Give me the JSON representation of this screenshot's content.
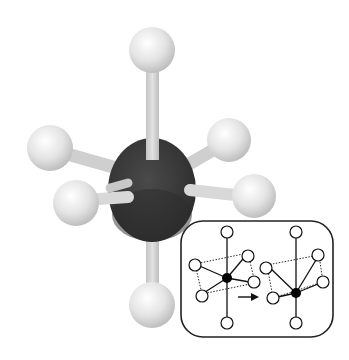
{
  "diagram": {
    "type": "molecular-geometry",
    "colors": {
      "background": "#ffffff",
      "central_atom": "#3a3a3a",
      "ligand_atom": "#e6e6e6",
      "bond": "#d4d4d4",
      "inset_border": "#222222",
      "inset_line": "#111111"
    },
    "central_atom": {
      "cx": 152,
      "cy": 190,
      "rx": 44,
      "ry": 52
    },
    "ligands": [
      {
        "id": "top",
        "cx": 152,
        "cy": 50,
        "r": 23
      },
      {
        "id": "upper-left",
        "cx": 50,
        "cy": 148,
        "r": 23
      },
      {
        "id": "upper-right",
        "cx": 229,
        "cy": 140,
        "r": 22
      },
      {
        "id": "lower-left",
        "cx": 76,
        "cy": 203,
        "r": 23
      },
      {
        "id": "lower-right",
        "cx": 254,
        "cy": 196,
        "r": 22
      },
      {
        "id": "bottom",
        "cx": 152,
        "cy": 305,
        "r": 23
      }
    ],
    "inset": {
      "x": 181,
      "y": 221,
      "width": 152,
      "height": 116,
      "radius": 22,
      "arrow": "→",
      "panels": [
        {
          "label": "before",
          "center": [
            226,
            293
          ]
        },
        {
          "label": "after",
          "center": [
            295,
            305
          ]
        }
      ]
    }
  }
}
